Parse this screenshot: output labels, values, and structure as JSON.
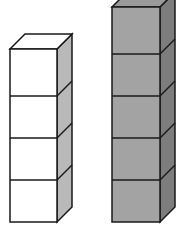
{
  "diagram": {
    "colors": {
      "white_front": "#ffffff",
      "white_side": "#b9b9b9",
      "white_top": "#ffffff",
      "gray_front": "#a3a3a3",
      "gray_side": "#7d7d7d",
      "gray_top": "#9a9a9a",
      "stroke": "#1a1a1a"
    },
    "stacks": [
      {
        "name": "white-stack",
        "cube_count": 4,
        "fill": "white"
      },
      {
        "name": "gray-stack",
        "cube_count": 5,
        "fill": "gray"
      }
    ]
  }
}
